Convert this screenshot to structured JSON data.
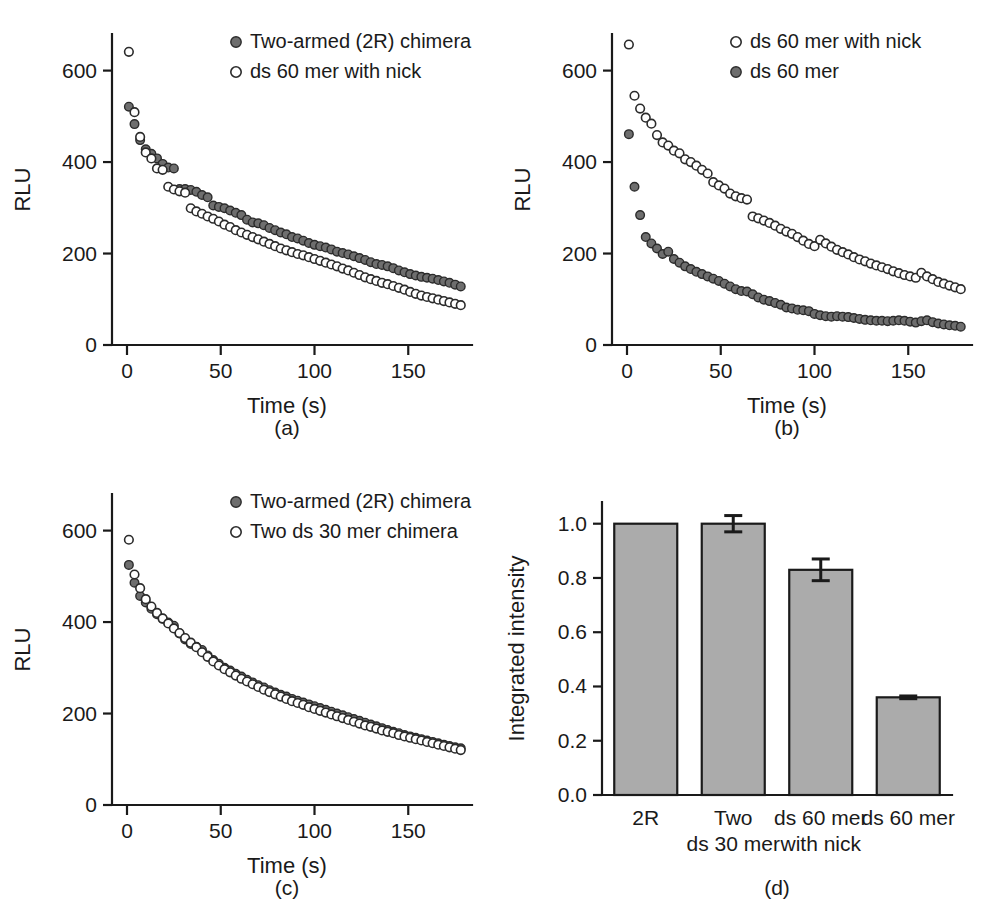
{
  "figure": {
    "background_color": "#ffffff",
    "ink_color": "#1a1a1a",
    "filled_marker_color": "#6e6e6e",
    "open_marker_color": "#ffffff",
    "bar_fill_color": "#ababab"
  },
  "panels": [
    {
      "id": "a",
      "label": "(a)",
      "legend": [
        {
          "marker": "filled-circle-icon",
          "label": "Two-armed (2R) chimera"
        },
        {
          "marker": "open-circle-icon",
          "label": "ds 60 mer with nick"
        }
      ]
    },
    {
      "id": "b",
      "label": "(b)",
      "legend": [
        {
          "marker": "open-circle-icon",
          "label": "ds 60 mer with nick"
        },
        {
          "marker": "filled-circle-icon",
          "label": "ds 60 mer"
        }
      ]
    },
    {
      "id": "c",
      "label": "(c)",
      "legend": [
        {
          "marker": "filled-circle-icon",
          "label": "Two-armed (2R) chimera"
        },
        {
          "marker": "open-circle-icon",
          "label": "Two ds 30 mer chimera"
        }
      ]
    },
    {
      "id": "d",
      "label": "(d)",
      "legend": []
    }
  ],
  "chart_data": [
    {
      "panel": "a",
      "type": "scatter",
      "title": "",
      "xlabel": "Time (s)",
      "ylabel": "RLU",
      "xlim": [
        -8,
        184
      ],
      "ylim": [
        0,
        680
      ],
      "xticks": [
        0,
        50,
        100,
        150
      ],
      "xtick_labels": [
        "0",
        "50",
        "100",
        "150"
      ],
      "yticks": [
        0,
        200,
        400,
        600
      ],
      "ytick_labels": [
        "0",
        "200",
        "400",
        "600"
      ],
      "grid": false,
      "legend_position": "top-right",
      "series": [
        {
          "name": "Two-armed (2R) chimera",
          "marker": "filled-circle",
          "color": "#6e6e6e",
          "x": [
            1,
            4,
            7,
            10,
            13,
            16,
            19,
            22,
            25,
            28,
            31,
            34,
            37,
            40,
            43,
            46,
            49,
            52,
            55,
            58,
            61,
            64,
            67,
            70,
            73,
            76,
            79,
            82,
            85,
            88,
            91,
            94,
            97,
            100,
            103,
            106,
            109,
            112,
            115,
            118,
            121,
            124,
            127,
            130,
            133,
            136,
            139,
            142,
            145,
            148,
            151,
            154,
            157,
            160,
            163,
            166,
            169,
            172,
            175,
            178
          ],
          "y": [
            521,
            483,
            448,
            428,
            418,
            408,
            396,
            388,
            386,
            341,
            341,
            339,
            335,
            328,
            323,
            305,
            302,
            299,
            294,
            289,
            284,
            274,
            268,
            266,
            262,
            256,
            251,
            246,
            242,
            236,
            233,
            228,
            223,
            219,
            216,
            213,
            209,
            204,
            201,
            198,
            194,
            190,
            186,
            181,
            177,
            175,
            172,
            168,
            163,
            159,
            155,
            152,
            149,
            147,
            145,
            142,
            139,
            136,
            132,
            128
          ]
        },
        {
          "name": "ds 60 mer with nick",
          "marker": "open-circle",
          "color": "#ffffff",
          "x": [
            1,
            4,
            7,
            10,
            13,
            16,
            19,
            22,
            25,
            28,
            31,
            34,
            37,
            40,
            43,
            46,
            49,
            52,
            55,
            58,
            61,
            64,
            67,
            70,
            73,
            76,
            79,
            82,
            85,
            88,
            91,
            94,
            97,
            100,
            103,
            106,
            109,
            112,
            115,
            118,
            121,
            124,
            127,
            130,
            133,
            136,
            139,
            142,
            145,
            148,
            151,
            154,
            157,
            160,
            163,
            166,
            169,
            172,
            175,
            178
          ],
          "y": [
            641,
            509,
            455,
            421,
            408,
            386,
            383,
            346,
            340,
            336,
            333,
            299,
            292,
            287,
            281,
            276,
            270,
            263,
            258,
            251,
            246,
            241,
            236,
            231,
            226,
            221,
            216,
            211,
            207,
            203,
            199,
            196,
            192,
            188,
            184,
            180,
            176,
            172,
            167,
            163,
            158,
            153,
            148,
            144,
            140,
            136,
            133,
            129,
            125,
            121,
            116,
            112,
            108,
            105,
            102,
            99,
            96,
            93,
            90,
            87
          ]
        }
      ]
    },
    {
      "panel": "b",
      "type": "scatter",
      "title": "",
      "xlabel": "Time (s)",
      "ylabel": "RLU",
      "xlim": [
        -8,
        184
      ],
      "ylim": [
        0,
        680
      ],
      "xticks": [
        0,
        50,
        100,
        150
      ],
      "xtick_labels": [
        "0",
        "50",
        "100",
        "150"
      ],
      "yticks": [
        0,
        200,
        400,
        600
      ],
      "ytick_labels": [
        "0",
        "200",
        "400",
        "600"
      ],
      "grid": false,
      "legend_position": "top-right",
      "series": [
        {
          "name": "ds 60 mer with nick",
          "marker": "open-circle",
          "color": "#ffffff",
          "x": [
            1,
            4,
            7,
            10,
            13,
            16,
            19,
            22,
            25,
            28,
            31,
            34,
            37,
            40,
            43,
            46,
            49,
            52,
            55,
            58,
            61,
            64,
            67,
            70,
            73,
            76,
            79,
            82,
            85,
            88,
            91,
            94,
            97,
            100,
            103,
            106,
            109,
            112,
            115,
            118,
            121,
            124,
            127,
            130,
            133,
            136,
            139,
            142,
            145,
            148,
            151,
            154,
            157,
            160,
            163,
            166,
            169,
            172,
            175,
            178
          ],
          "y": [
            657,
            545,
            517,
            497,
            484,
            459,
            443,
            436,
            425,
            419,
            406,
            400,
            392,
            383,
            375,
            356,
            349,
            342,
            331,
            325,
            321,
            318,
            281,
            277,
            272,
            267,
            261,
            254,
            248,
            243,
            236,
            228,
            221,
            216,
            230,
            222,
            215,
            208,
            203,
            198,
            192,
            187,
            183,
            178,
            174,
            170,
            166,
            161,
            157,
            153,
            150,
            147,
            158,
            150,
            144,
            138,
            134,
            130,
            126,
            122
          ]
        },
        {
          "name": "ds 60 mer",
          "marker": "filled-circle",
          "color": "#6e6e6e",
          "x": [
            1,
            4,
            7,
            10,
            13,
            16,
            19,
            22,
            25,
            28,
            31,
            34,
            37,
            40,
            43,
            46,
            49,
            52,
            55,
            58,
            61,
            64,
            67,
            70,
            73,
            76,
            79,
            82,
            85,
            88,
            91,
            94,
            97,
            100,
            103,
            106,
            109,
            112,
            115,
            118,
            121,
            124,
            127,
            130,
            133,
            136,
            139,
            142,
            145,
            148,
            151,
            154,
            157,
            160,
            163,
            166,
            169,
            172,
            175,
            178
          ],
          "y": [
            461,
            346,
            284,
            236,
            222,
            211,
            199,
            204,
            188,
            180,
            172,
            166,
            160,
            155,
            150,
            145,
            140,
            134,
            128,
            122,
            118,
            117,
            111,
            104,
            99,
            96,
            92,
            88,
            82,
            80,
            77,
            76,
            74,
            68,
            65,
            63,
            62,
            63,
            62,
            61,
            59,
            57,
            55,
            54,
            53,
            53,
            52,
            53,
            54,
            53,
            51,
            49,
            52,
            54,
            50,
            47,
            45,
            43,
            42,
            40
          ]
        }
      ]
    },
    {
      "panel": "c",
      "type": "scatter",
      "title": "",
      "xlabel": "Time (s)",
      "ylabel": "RLU",
      "xlim": [
        -8,
        184
      ],
      "ylim": [
        0,
        680
      ],
      "xticks": [
        0,
        50,
        100,
        150
      ],
      "xtick_labels": [
        "0",
        "50",
        "100",
        "150"
      ],
      "yticks": [
        0,
        200,
        400,
        600
      ],
      "ytick_labels": [
        "0",
        "200",
        "400",
        "600"
      ],
      "grid": false,
      "legend_position": "top-right",
      "series": [
        {
          "name": "Two-armed (2R) chimera",
          "marker": "filled-circle",
          "color": "#6e6e6e",
          "x": [
            1,
            4,
            7,
            10,
            13,
            16,
            19,
            22,
            25,
            28,
            31,
            34,
            37,
            40,
            43,
            46,
            49,
            52,
            55,
            58,
            61,
            64,
            67,
            70,
            73,
            76,
            79,
            82,
            85,
            88,
            91,
            94,
            97,
            100,
            103,
            106,
            109,
            112,
            115,
            118,
            121,
            124,
            127,
            130,
            133,
            136,
            139,
            142,
            145,
            148,
            151,
            154,
            157,
            160,
            163,
            166,
            169,
            172,
            175,
            178
          ],
          "y": [
            525,
            486,
            457,
            443,
            429,
            417,
            407,
            399,
            392,
            375,
            362,
            352,
            346,
            339,
            327,
            317,
            309,
            300,
            294,
            287,
            281,
            274,
            268,
            262,
            257,
            251,
            246,
            241,
            237,
            232,
            228,
            224,
            220,
            216,
            212,
            208,
            204,
            200,
            196,
            192,
            188,
            184,
            180,
            176,
            172,
            168,
            164,
            160,
            157,
            153,
            150,
            147,
            144,
            141,
            138,
            135,
            132,
            129,
            126,
            124
          ]
        },
        {
          "name": "Two ds 30 mer chimera",
          "marker": "open-circle",
          "color": "#ffffff",
          "x": [
            1,
            4,
            7,
            10,
            13,
            16,
            19,
            22,
            25,
            28,
            31,
            34,
            37,
            40,
            43,
            46,
            49,
            52,
            55,
            58,
            61,
            64,
            67,
            70,
            73,
            76,
            79,
            82,
            85,
            88,
            91,
            94,
            97,
            100,
            103,
            106,
            109,
            112,
            115,
            118,
            121,
            124,
            127,
            130,
            133,
            136,
            139,
            142,
            145,
            148,
            151,
            154,
            157,
            160,
            163,
            166,
            169,
            172,
            175,
            178
          ],
          "y": [
            580,
            504,
            474,
            450,
            434,
            420,
            408,
            397,
            386,
            376,
            365,
            355,
            345,
            334,
            324,
            314,
            305,
            297,
            290,
            283,
            276,
            270,
            264,
            258,
            252,
            247,
            242,
            237,
            232,
            227,
            223,
            219,
            214,
            210,
            206,
            202,
            198,
            194,
            190,
            186,
            182,
            178,
            174,
            171,
            167,
            163,
            160,
            157,
            153,
            150,
            147,
            144,
            141,
            138,
            135,
            132,
            129,
            126,
            123,
            120
          ]
        }
      ]
    },
    {
      "panel": "d",
      "type": "bar",
      "title": "",
      "xlabel": "",
      "ylabel": "Integrated intensity",
      "categories": [
        "2R",
        "Two ds 30 mer",
        "ds 60 mer with nick",
        "ds 60 mer"
      ],
      "category_lines": [
        [
          "2R",
          ""
        ],
        [
          "Two",
          "ds 30 mer"
        ],
        [
          "ds 60 mer",
          "with nick"
        ],
        [
          "ds 60 mer",
          ""
        ]
      ],
      "values": [
        1.0,
        1.0,
        0.83,
        0.36
      ],
      "errors": [
        0.0,
        0.03,
        0.04,
        0.005
      ],
      "ylim": [
        0.0,
        1.08
      ],
      "yticks": [
        0.0,
        0.2,
        0.4,
        0.6,
        0.8,
        1.0
      ],
      "ytick_labels": [
        "0.0",
        "0.2",
        "0.4",
        "0.6",
        "0.8",
        "1.0"
      ],
      "grid": false,
      "legend_position": "none",
      "bar_fill": "#ababab",
      "bar_stroke": "#1a1a1a"
    }
  ]
}
